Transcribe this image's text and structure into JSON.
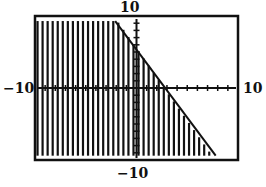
{
  "chart_data": {
    "type": "area",
    "title": "",
    "xlabel": "",
    "ylabel": "",
    "xlim": [
      -10,
      10
    ],
    "ylim": [
      -10,
      10
    ],
    "xscale_tick": 1,
    "yscale_tick": 1,
    "grid": false,
    "boundary_line": {
      "slope": -2,
      "y_intercept": 5.5,
      "x_intercept": 2.8,
      "points": [
        [
          -2.1,
          9.3
        ],
        [
          0,
          5.5
        ],
        [
          2.8,
          0
        ],
        [
          7.8,
          -9.4
        ]
      ]
    },
    "shading": {
      "region": "below line",
      "style": "vertical stripes",
      "x_from": -10,
      "x_to": 7.8,
      "y_top_cap": 9.3,
      "y_bottom": -9.4
    },
    "window_labels": {
      "ymax": "10",
      "ymin": "−10",
      "xmin": "−10",
      "xmax": "10"
    },
    "colors": {
      "ink": "#111111",
      "background": "#ffffff"
    }
  }
}
